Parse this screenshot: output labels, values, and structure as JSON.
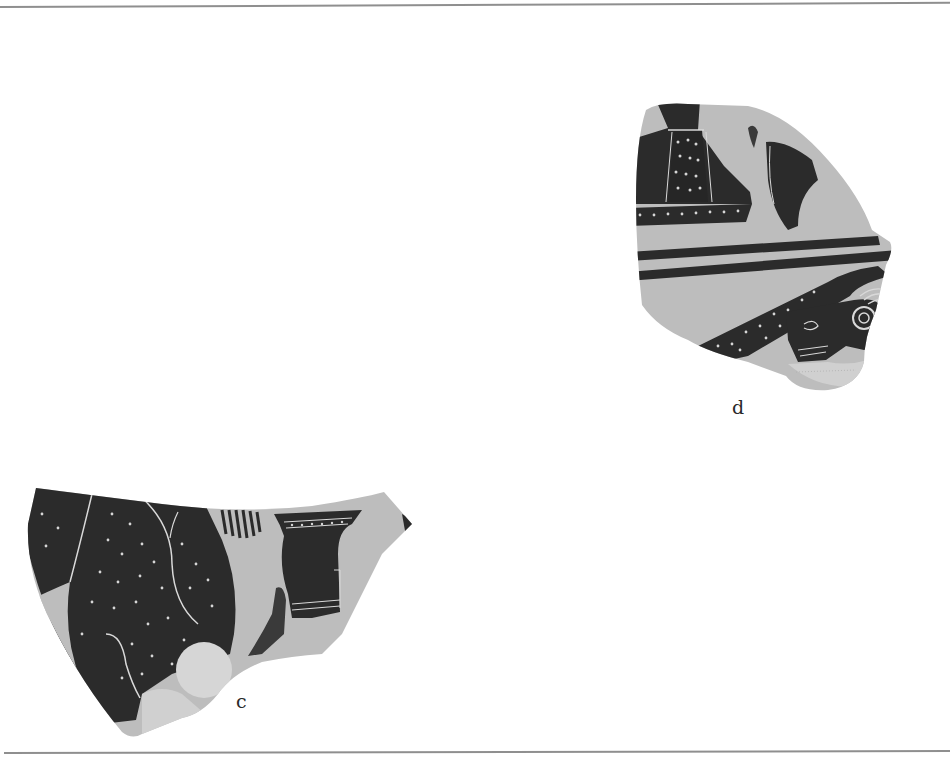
{
  "page": {
    "type": "catalogue plate",
    "background": "#ffffff",
    "rule_color": "#8f8f8f"
  },
  "figures": [
    {
      "label": "d",
      "description": "Black-figure sherd: robed figure with dotted garment at upper left, legs/feet of figure at upper right, two horizontal ground-line bands, lower frieze with dotted dark band and animal (bird/cock) head with concentric eye",
      "position": "upper right"
    },
    {
      "label": "c",
      "description": "Black-figure sherd: large dark dotted garment with incised fold lines at left, fringed edge, pale disc (shield) at bottom center, decorated vessel/column-krater-like object with horizontal bands at right",
      "position": "lower left"
    }
  ],
  "colors": {
    "slip_black": "#2b2b2b",
    "clay_light": "#bdbdbd",
    "clay_pale": "#d6d6d6",
    "incision": "#d9d9d9",
    "caption_text": "#2a2a2a"
  }
}
